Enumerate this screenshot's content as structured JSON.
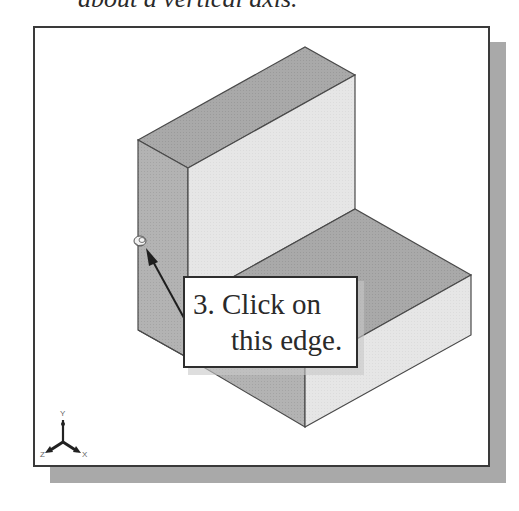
{
  "caption": {
    "top_text": "about a vertical axis."
  },
  "viewport": {
    "background": "#ffffff",
    "border_color": "#3a3a3a",
    "shadow_color": "#a9a9a9"
  },
  "model": {
    "type": "L-shaped block (isometric view)",
    "colors": {
      "top_face": "#a8a8a8",
      "left_face": "#b0b0b0",
      "front_face": "#e4e4e4",
      "edge": "#4a4a4a"
    }
  },
  "callout": {
    "line1": "3. Click on",
    "line2": "this edge."
  },
  "cursor": {
    "icon": "rotate-cursor-icon"
  },
  "triad": {
    "x_label": "X",
    "y_label": "Y",
    "z_label": "Z"
  }
}
